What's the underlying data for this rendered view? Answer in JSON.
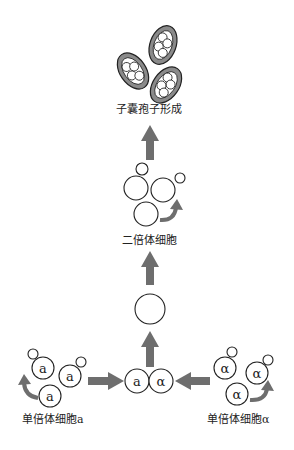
{
  "diagram": {
    "type": "yeast life cycle",
    "stages": {
      "ascospore_formation": {
        "label": "子囊孢子形成"
      },
      "diploid": {
        "label": "二倍体细胞"
      },
      "haploid_a": {
        "label": "单倍体细胞a",
        "cell_letter": "a"
      },
      "haploid_alpha": {
        "label": "单倍体细胞α",
        "cell_letter": "α"
      },
      "mating": {
        "left_letter": "a",
        "right_letter": "α"
      }
    },
    "colors": {
      "arrow": "#6e6e6e",
      "outline": "#222222",
      "ascus_fill": "#8a8a8a",
      "spore_fill": "#ffffff"
    }
  }
}
